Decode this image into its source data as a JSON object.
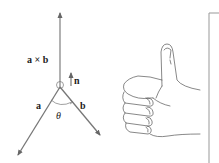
{
  "diagram": {
    "labels": {
      "cross_product": "a × b",
      "normal": "n",
      "vector_a": "a",
      "vector_b": "b",
      "angle": "θ"
    },
    "vectors": [
      {
        "name": "a × b",
        "from": [
          60,
          87
        ],
        "to": [
          60,
          13
        ]
      },
      {
        "name": "a",
        "from": [
          60,
          87
        ],
        "to": [
          18,
          155
        ]
      },
      {
        "name": "b",
        "from": [
          60,
          87
        ],
        "to": [
          100,
          135
        ]
      },
      {
        "name": "n",
        "from": [
          71,
          86
        ],
        "to": [
          71,
          73
        ]
      }
    ],
    "illustration": "right hand with thumb up",
    "colors": {
      "line": "#777777",
      "text": "#222222",
      "background": "#ffffff"
    }
  }
}
